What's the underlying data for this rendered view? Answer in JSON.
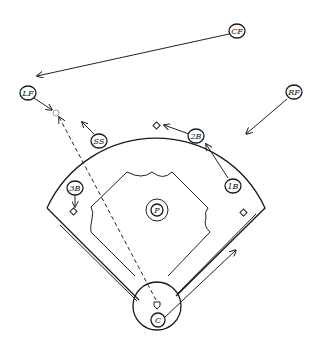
{
  "diagram": {
    "type": "baseball-field-defensive-play",
    "players": [
      {
        "id": "cf",
        "label": "CF",
        "x": 237,
        "y": 31
      },
      {
        "id": "lf",
        "label": "LF",
        "x": 28,
        "y": 93
      },
      {
        "id": "rf",
        "label": "RF",
        "x": 294,
        "y": 92
      },
      {
        "id": "ss",
        "label": "SS",
        "x": 99,
        "y": 141
      },
      {
        "id": "2b",
        "label": "2B",
        "x": 196,
        "y": 136
      },
      {
        "id": "1b",
        "label": "1B",
        "x": 233,
        "y": 186
      },
      {
        "id": "3b",
        "label": "3B",
        "x": 75,
        "y": 188
      },
      {
        "id": "p",
        "label": "P",
        "x": 157,
        "y": 210
      },
      {
        "id": "c",
        "label": "C",
        "x": 158,
        "y": 320
      }
    ],
    "movements": [
      {
        "from": "CF",
        "toward": "left field",
        "style": "solid-arrow"
      },
      {
        "from": "LF",
        "toward": "ball",
        "style": "solid-arrow"
      },
      {
        "from": "RF",
        "toward": "infield",
        "style": "solid-arrow"
      },
      {
        "from": "SS",
        "toward": "outfield",
        "style": "solid-arrow"
      },
      {
        "from": "2B",
        "toward": "second base",
        "style": "solid-arrow"
      },
      {
        "from": "1B",
        "toward": "2B position",
        "style": "solid-arrow"
      },
      {
        "from": "3B",
        "toward": "third base",
        "style": "solid-arrow"
      },
      {
        "from": "C",
        "toward": "first base line",
        "style": "solid-arrow"
      },
      {
        "from": "home plate",
        "toward": "ball in left field",
        "style": "dashed-arrow"
      }
    ],
    "ball_marker": {
      "x": 56,
      "y": 113
    }
  }
}
